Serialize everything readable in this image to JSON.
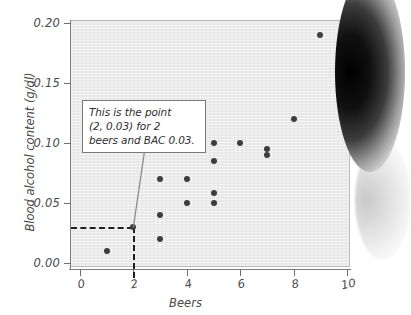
{
  "figure": {
    "panel_background": "#ebebeb",
    "point_color": "#3d3d3d",
    "axis_color": "#7d7d7d"
  },
  "annotation": {
    "line1": "This is the point",
    "line2": "(2, 0.03) for 2",
    "line3": "beers and BAC 0.03.",
    "highlight_x": 2,
    "highlight_y": 0.03
  },
  "chart_data": {
    "type": "scatter",
    "title": "",
    "xlabel": "Beers",
    "ylabel": "Blood alcohol content (g/dl)",
    "xlim": [
      -0.6,
      10.6
    ],
    "ylim": [
      -0.012,
      0.212
    ],
    "xticks": [
      0,
      2,
      4,
      6,
      8,
      10
    ],
    "xtick_labels": [
      "0",
      "2",
      "4",
      "6",
      "8",
      "10"
    ],
    "yticks": [
      0.0,
      0.05,
      0.1,
      0.15,
      0.2
    ],
    "ytick_labels": [
      "0.00",
      "0.05",
      "0.10",
      "0.15",
      "0.20"
    ],
    "grid": false,
    "legend": null,
    "points": [
      {
        "x": 1,
        "y": 0.01
      },
      {
        "x": 2,
        "y": 0.03
      },
      {
        "x": 3,
        "y": 0.02
      },
      {
        "x": 3,
        "y": 0.04
      },
      {
        "x": 3,
        "y": 0.07
      },
      {
        "x": 4,
        "y": 0.05
      },
      {
        "x": 4,
        "y": 0.07
      },
      {
        "x": 5,
        "y": 0.05
      },
      {
        "x": 5,
        "y": 0.058
      },
      {
        "x": 5,
        "y": 0.085
      },
      {
        "x": 5,
        "y": 0.1
      },
      {
        "x": 6,
        "y": 0.1
      },
      {
        "x": 7,
        "y": 0.09
      },
      {
        "x": 7,
        "y": 0.095
      },
      {
        "x": 8,
        "y": 0.12
      },
      {
        "x": 9,
        "y": 0.19
      }
    ],
    "annotations": [
      {
        "text": "This is the point (2, 0.03) for 2 beers and BAC 0.03.",
        "points_to": {
          "x": 2,
          "y": 0.03
        }
      }
    ]
  }
}
